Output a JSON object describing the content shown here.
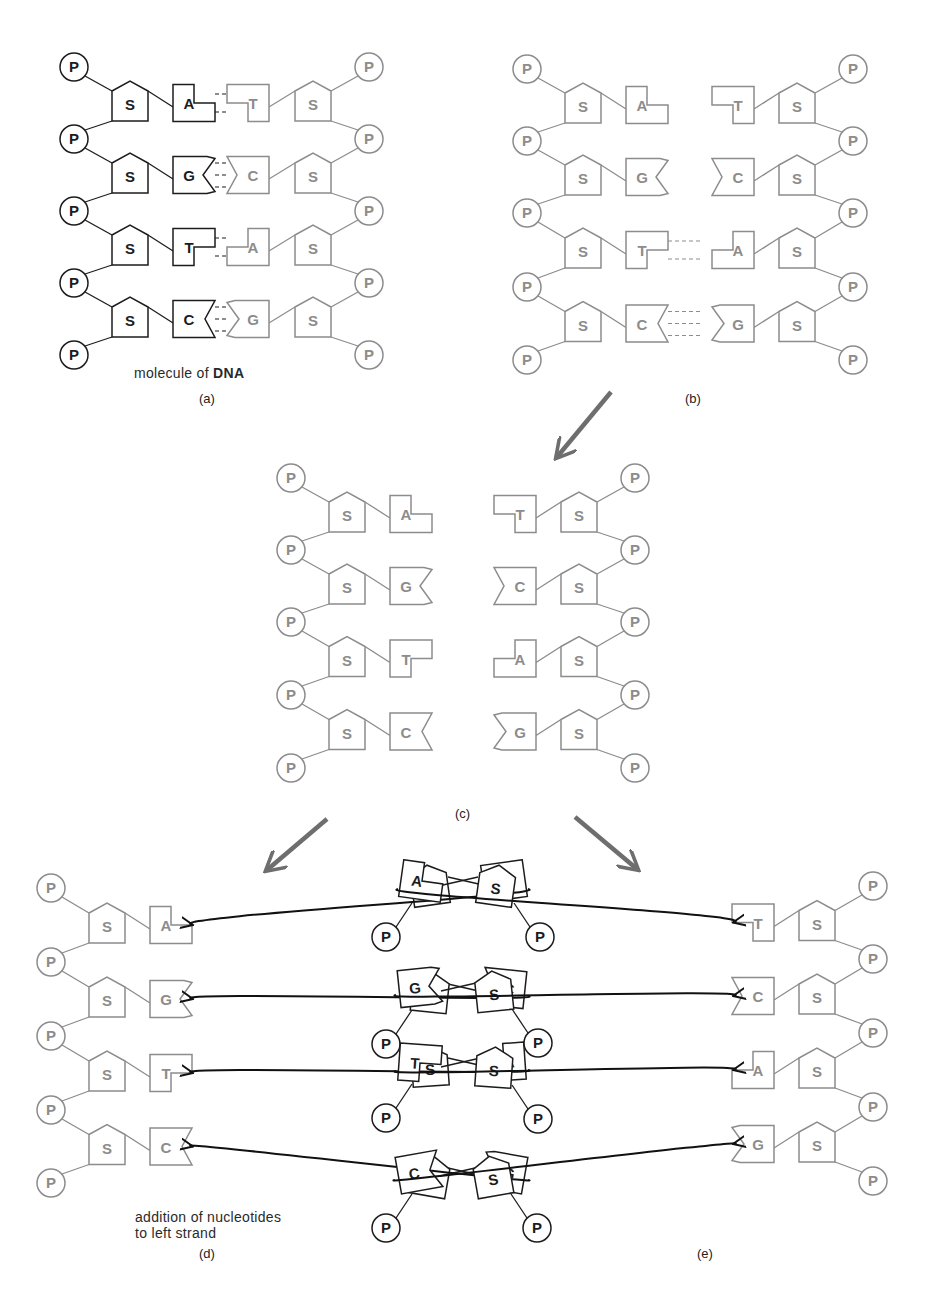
{
  "colors": {
    "dark": "#1c1c1c",
    "light": "#8c8c8c",
    "arrow": "#6e6e6e",
    "background": "#ffffff"
  },
  "symbols": {
    "phosphate": "P",
    "sugar": "S"
  },
  "labels": {
    "a": "(a)",
    "b": "(b)",
    "c": "(c)",
    "d": "(d)",
    "e": "(e)",
    "caption_a_prefix": "molecule of ",
    "caption_a_bold": "DNA",
    "caption_d_line1": "addition of nucleotides",
    "caption_d_line2": "to left strand"
  },
  "panels": {
    "a": {
      "left_strand": {
        "tone": "dark",
        "x": 74,
        "p_y": [
          67,
          139,
          211,
          283,
          355
        ],
        "bases": [
          "A",
          "G",
          "T",
          "C"
        ]
      },
      "right_strand": {
        "tone": "light",
        "x": 369,
        "p_y": [
          67,
          139,
          211,
          283,
          355
        ],
        "bases": [
          "T",
          "C",
          "A",
          "G"
        ]
      },
      "bonded_rows": [
        0,
        1,
        2,
        3
      ],
      "gap": 0
    },
    "b": {
      "left_strand": {
        "tone": "light",
        "x": 527,
        "p_y": [
          69,
          141,
          213,
          287,
          360
        ],
        "bases": [
          "A",
          "G",
          "T",
          "C"
        ]
      },
      "right_strand": {
        "tone": "light",
        "x": 853,
        "p_y": [
          69,
          141,
          213,
          287,
          360
        ],
        "bases": [
          "T",
          "C",
          "A",
          "G"
        ]
      },
      "bonded_rows": [
        2,
        3
      ],
      "gap_rows": [
        44,
        34,
        6,
        0
      ]
    },
    "c": {
      "left_strand": {
        "tone": "light",
        "x": 291,
        "p_y": [
          478,
          550,
          622,
          695,
          768
        ],
        "bases": [
          "A",
          "G",
          "T",
          "C"
        ]
      },
      "right_strand": {
        "tone": "light",
        "x": 635,
        "p_y": [
          478,
          550,
          622,
          695,
          768
        ],
        "bases": [
          "T",
          "C",
          "A",
          "G"
        ]
      }
    },
    "d": {
      "template_strand": {
        "tone": "light",
        "side": "left",
        "x": 51,
        "p_y": [
          888,
          962,
          1036,
          1110,
          1183
        ],
        "bases": [
          "A",
          "G",
          "T",
          "C"
        ]
      },
      "incoming_nucleotides": [
        {
          "base": "T",
          "p": [
            386,
            937
          ]
        },
        {
          "base": "C",
          "p": [
            386,
            1044
          ]
        },
        {
          "base": "A",
          "p": [
            386,
            1118
          ]
        },
        {
          "base": "G",
          "p": [
            386,
            1228
          ]
        }
      ]
    },
    "e": {
      "template_strand": {
        "tone": "light",
        "side": "right",
        "x": 873,
        "p_y": [
          886,
          959,
          1033,
          1107,
          1181
        ],
        "bases": [
          "T",
          "C",
          "A",
          "G"
        ]
      },
      "incoming_nucleotides": [
        {
          "base": "A",
          "p": [
            540,
            937
          ]
        },
        {
          "base": "G",
          "p": [
            538,
            1043
          ]
        },
        {
          "base": "T",
          "p": [
            538,
            1119
          ]
        },
        {
          "base": "C",
          "p": [
            537,
            1228
          ]
        }
      ]
    }
  },
  "flow_arrows": [
    {
      "from": [
        611,
        392
      ],
      "to": [
        557,
        457
      ]
    },
    {
      "from": [
        327,
        819
      ],
      "to": [
        267,
        870
      ]
    },
    {
      "from": [
        575,
        817
      ],
      "to": [
        637,
        869
      ]
    }
  ]
}
